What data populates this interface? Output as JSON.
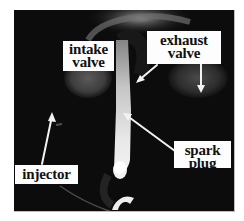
{
  "figure": {
    "colors": {
      "page_background": "#ffffff",
      "photo_background": "#0c0c0c",
      "label_background": "#fdfdfd",
      "label_text": "#111111",
      "arrow": "#f2f2f2"
    },
    "labels": {
      "intake_valve": {
        "line1": "intake",
        "line2": "valve"
      },
      "exhaust_valve": {
        "line1": "exhaust",
        "line2": "valve"
      },
      "spark_plug": {
        "line1": "spark",
        "line2": "plug"
      },
      "injector": {
        "line1": "injector"
      }
    }
  }
}
